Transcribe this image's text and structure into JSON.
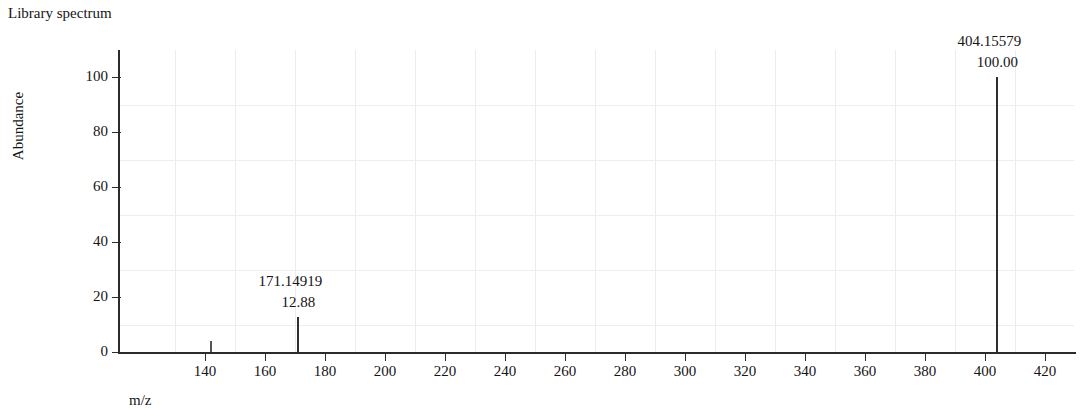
{
  "title": "Library spectrum",
  "axes": {
    "y_title": "Abundance",
    "x_title": "m/z"
  },
  "chart_data": {
    "type": "bar",
    "title": "Library spectrum",
    "xlabel": "m/z",
    "ylabel": "Abundance",
    "xlim": [
      126,
      430
    ],
    "ylim": [
      0,
      110
    ],
    "grid": true,
    "legend": "none",
    "x_ticks": [
      140,
      160,
      180,
      200,
      220,
      240,
      260,
      280,
      300,
      320,
      340,
      360,
      380,
      400,
      420
    ],
    "y_ticks": [
      0,
      20,
      40,
      60,
      80,
      100
    ],
    "peaks": [
      {
        "mz": 142.0,
        "abundance": 4.0,
        "mz_label": "",
        "abundance_label": "",
        "labeled": false
      },
      {
        "mz": 171.14919,
        "abundance": 12.88,
        "mz_label": "171.14919",
        "abundance_label": "12.88",
        "labeled": true
      },
      {
        "mz": 404.15579,
        "abundance": 100.0,
        "mz_label": "404.15579",
        "abundance_label": "100.00",
        "labeled": true
      }
    ]
  }
}
